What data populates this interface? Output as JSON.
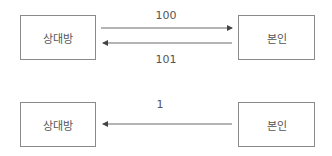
{
  "diagrams": [
    {
      "left_box": "상대방",
      "right_box": "본인",
      "arrows": [
        {
          "label": "100",
          "direction": "left-to-right"
        },
        {
          "label": "101",
          "direction": "right-to-left"
        }
      ]
    },
    {
      "left_box": "상대방",
      "right_box": "본인",
      "arrows": [
        {
          "label": "1",
          "direction": "right-to-left"
        }
      ]
    }
  ],
  "colors": {
    "line": "#6a6a6a",
    "border": "#8a8a8a",
    "text": "#555555"
  }
}
